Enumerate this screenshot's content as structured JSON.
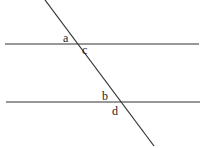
{
  "diagram": {
    "type": "parallel-lines-transversal",
    "colors": {
      "line": "#333333",
      "text": "#222222",
      "background": "#ffffff"
    },
    "lines": {
      "top_parallel": {
        "x1": 5,
        "y1": 44,
        "x2": 199,
        "y2": 44
      },
      "bottom_parallel": {
        "x1": 6,
        "y1": 102,
        "x2": 200,
        "y2": 102
      },
      "transversal": {
        "x1": 45,
        "y1": 0,
        "x2": 154,
        "y2": 146
      }
    },
    "labels": [
      {
        "id": "a",
        "text": "a",
        "x": 63,
        "y": 42
      },
      {
        "id": "c",
        "text": "c",
        "x": 82,
        "y": 54
      },
      {
        "id": "b",
        "text": "b",
        "x": 102,
        "y": 100
      },
      {
        "id": "d",
        "text": "d",
        "x": 112,
        "y": 115
      }
    ]
  }
}
